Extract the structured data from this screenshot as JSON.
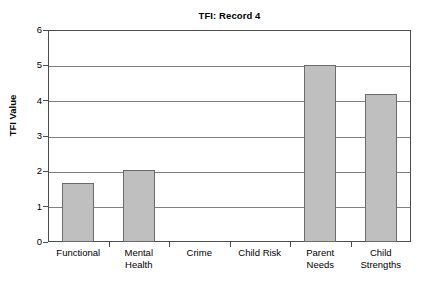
{
  "chart_data": {
    "type": "bar",
    "title": "TFI: Record 4",
    "xlabel": "",
    "ylabel": "TFI Value",
    "categories": [
      "Functional",
      "Mental Health",
      "Crime",
      "Child Risk",
      "Parent Needs",
      "Child Strengths"
    ],
    "category_lines": [
      [
        "Functional"
      ],
      [
        "Mental",
        "Health"
      ],
      [
        "Crime"
      ],
      [
        "Child Risk"
      ],
      [
        "Parent",
        "Needs"
      ],
      [
        "Child",
        "Strengths"
      ]
    ],
    "values": [
      1.67,
      2.03,
      0,
      0,
      5.0,
      4.2
    ],
    "ylim": [
      0,
      6
    ],
    "ytick_step": 1,
    "yticks": [
      6,
      5,
      4,
      3,
      2,
      1,
      0
    ],
    "grid": true,
    "legend": false,
    "bar_color": "#bfbfbf",
    "bar_border_color": "#6b6b6b",
    "gridline_color": "#808080",
    "axis_color": "#4d4d4d"
  }
}
